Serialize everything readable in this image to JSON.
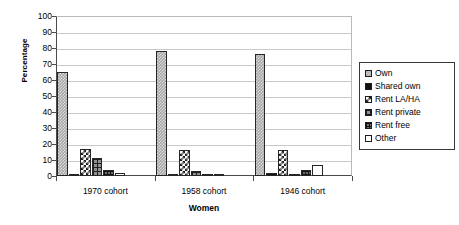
{
  "chart_data": {
    "type": "bar",
    "title": "",
    "xlabel": "Women",
    "ylabel": "Percentage",
    "ylim": [
      0,
      100
    ],
    "ytick_step": 10,
    "yticks": [
      100,
      90,
      80,
      70,
      60,
      50,
      40,
      30,
      20,
      10,
      0
    ],
    "grid": true,
    "legend_position": "right",
    "categories": [
      "1970 cohort",
      "1958 cohort",
      "1946 cohort"
    ],
    "series": [
      {
        "name": "Own",
        "pattern": "grey-checker",
        "values": [
          65,
          78,
          76
        ]
      },
      {
        "name": "Shared own",
        "pattern": "solid-black",
        "values": [
          0.5,
          0.5,
          2
        ]
      },
      {
        "name": "Rent LA/HA",
        "pattern": "diagonal-check",
        "values": [
          17,
          16,
          16
        ]
      },
      {
        "name": "Rent private",
        "pattern": "grid-dark",
        "values": [
          11,
          3,
          0.5
        ]
      },
      {
        "name": "Rent free",
        "pattern": "fine-grid",
        "values": [
          4,
          1,
          4
        ]
      },
      {
        "name": "Other",
        "pattern": "white",
        "values": [
          2,
          0.5,
          7
        ]
      }
    ]
  },
  "legend": {
    "items": [
      {
        "label": "Own"
      },
      {
        "label": "Shared own"
      },
      {
        "label": "Rent LA/HA"
      },
      {
        "label": "Rent private"
      },
      {
        "label": "Rent free"
      },
      {
        "label": "Other"
      }
    ]
  },
  "colors": {
    "axis": "#4a4a4a",
    "grid": "#c9c9c9",
    "bar_outline": "#262626",
    "background": "#ffffff"
  }
}
